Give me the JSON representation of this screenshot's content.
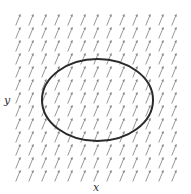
{
  "figure": {
    "type": "vector-field-with-closed-curve",
    "axis_labels": {
      "x": "x",
      "y": "y"
    },
    "field": {
      "description": "uniform direction field, arrows pointing steeply up-right",
      "grid": {
        "cols": 13,
        "rows": 13,
        "x0": 18,
        "y0": 20,
        "dx": 13,
        "dy": 13
      },
      "arrow": {
        "dx": 4.5,
        "dy": -11,
        "color": "#8a8a8a"
      }
    },
    "curve": {
      "shape": "ellipse",
      "cx": 97.5,
      "cy": 100,
      "rx": 55.5,
      "ry": 41,
      "stroke": "#2a2a2a",
      "stroke_width": 2
    }
  }
}
